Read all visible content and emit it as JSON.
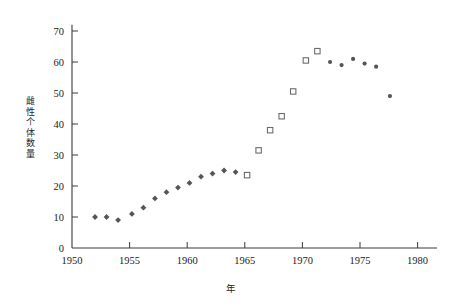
{
  "chart_data": {
    "type": "scatter",
    "title": "",
    "xlabel": "年",
    "ylabel": "雌性个体数量",
    "xlim": [
      1950,
      1981.5
    ],
    "ylim": [
      0,
      72
    ],
    "xticks": [
      1950,
      1955,
      1960,
      1965,
      1970,
      1975,
      1980
    ],
    "xtick_labels": [
      "1950",
      "1955",
      "1960",
      "1965",
      "1970",
      "1975",
      "1980"
    ],
    "yticks": [
      0,
      10,
      20,
      30,
      40,
      50,
      60,
      70
    ],
    "ytick_labels": [
      "0",
      "10",
      "20",
      "30",
      "40",
      "50",
      "60",
      "70"
    ],
    "grid": false,
    "legend": "none",
    "series": [
      {
        "name": "早期计数",
        "marker": "filled-diamond",
        "color": "#555556",
        "points": [
          {
            "x": 1952.0,
            "y": 10.0
          },
          {
            "x": 1953.0,
            "y": 10.0
          },
          {
            "x": 1954.0,
            "y": 9.0
          },
          {
            "x": 1955.2,
            "y": 11.0
          },
          {
            "x": 1956.2,
            "y": 13.0
          },
          {
            "x": 1957.2,
            "y": 16.0
          },
          {
            "x": 1958.2,
            "y": 18.0
          },
          {
            "x": 1959.2,
            "y": 19.5
          },
          {
            "x": 1960.2,
            "y": 21.0
          },
          {
            "x": 1961.2,
            "y": 23.0
          },
          {
            "x": 1962.2,
            "y": 24.0
          },
          {
            "x": 1963.2,
            "y": 25.0
          },
          {
            "x": 1964.2,
            "y": 24.5
          }
        ]
      },
      {
        "name": "中期计数",
        "marker": "open-square",
        "color": "#6d6d70",
        "points": [
          {
            "x": 1965.2,
            "y": 23.5
          },
          {
            "x": 1966.2,
            "y": 31.5
          },
          {
            "x": 1967.2,
            "y": 38.0
          },
          {
            "x": 1968.2,
            "y": 42.5
          },
          {
            "x": 1969.2,
            "y": 50.5
          },
          {
            "x": 1970.3,
            "y": 60.5
          },
          {
            "x": 1971.3,
            "y": 63.5
          }
        ]
      },
      {
        "name": "后期计数",
        "marker": "filled-dot",
        "color": "#555556",
        "points": [
          {
            "x": 1972.4,
            "y": 60.0
          },
          {
            "x": 1973.4,
            "y": 59.0
          },
          {
            "x": 1974.4,
            "y": 61.0
          },
          {
            "x": 1975.4,
            "y": 59.5
          },
          {
            "x": 1976.4,
            "y": 58.5
          },
          {
            "x": 1977.6,
            "y": 49.0
          }
        ]
      }
    ]
  }
}
